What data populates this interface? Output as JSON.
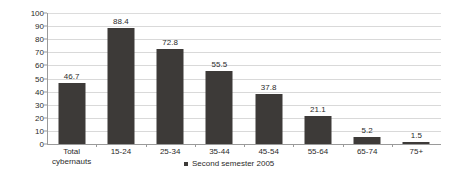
{
  "chart_data": {
    "type": "bar",
    "title": "",
    "subtitle": "",
    "xlabel": "",
    "ylabel": "",
    "categories": [
      "Total cybernauts",
      "15-24",
      "25-34",
      "35-44",
      "45-54",
      "55-64",
      "65-74",
      "75+"
    ],
    "category_lines": [
      [
        "Total",
        "cybernauts"
      ],
      [
        "15-24"
      ],
      [
        "25-34"
      ],
      [
        "35-44"
      ],
      [
        "45-54"
      ],
      [
        "55-64"
      ],
      [
        "65-74"
      ],
      [
        "75+"
      ]
    ],
    "values": [
      46.7,
      88.4,
      72.8,
      55.5,
      37.8,
      21.1,
      5.2,
      1.5
    ],
    "value_labels": [
      "46.7",
      "88.4",
      "72.8",
      "55.5",
      "37.8",
      "21.1",
      "5.2",
      "1.5"
    ],
    "series": [
      {
        "name": "Second semester 2005",
        "values": [
          46.7,
          88.4,
          72.8,
          55.5,
          37.8,
          21.1,
          5.2,
          1.5
        ],
        "color": "#3d3a38"
      }
    ],
    "ylim": [
      0,
      100
    ],
    "yticks": [
      0,
      10,
      20,
      30,
      40,
      50,
      60,
      70,
      80,
      90,
      100
    ],
    "ytick_labels": [
      "0",
      "10",
      "20",
      "30",
      "40",
      "50",
      "60",
      "70",
      "80",
      "90",
      "100"
    ],
    "grid": true,
    "grid_color": "#d9d9d9",
    "legend": {
      "position": "bottom-center",
      "entries": [
        {
          "label": "Second semester 2005",
          "color": "#3d3a38"
        }
      ]
    },
    "background_color": "#ffffff",
    "axis_color": "#9a9a9a",
    "text_color": "#2b2b2b"
  }
}
